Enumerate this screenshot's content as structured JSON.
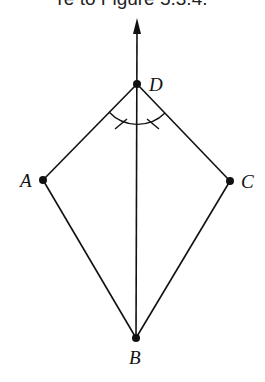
{
  "caption": "re to Figure 5.3.4.",
  "diagram": {
    "type": "kite-with-angle-bisector",
    "points": [
      {
        "id": "D",
        "label": "D",
        "x": 137,
        "y": 84
      },
      {
        "id": "A",
        "label": "A",
        "x": 43,
        "y": 180
      },
      {
        "id": "C",
        "label": "C",
        "x": 230,
        "y": 181
      },
      {
        "id": "B",
        "label": "B",
        "x": 136,
        "y": 338
      }
    ],
    "segments": [
      "DA",
      "DC",
      "AB",
      "CB",
      "DB"
    ],
    "ray": {
      "from": "B",
      "through": "D",
      "arrow_tip": {
        "x": 137,
        "y": 19
      }
    },
    "angle_mark": {
      "vertex": "D",
      "between": [
        "A",
        "C"
      ],
      "bisected": true,
      "tick_marks": 2
    },
    "line_color": "#111111"
  }
}
